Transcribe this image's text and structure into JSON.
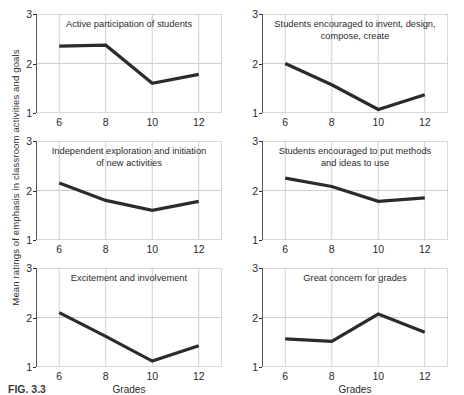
{
  "figure": {
    "ylabel": "Mean ratings of emphasis in classroom activities and goals",
    "xlabel": "Grades",
    "caption": "FIG. 3.3"
  },
  "chart_data": {
    "type": "line",
    "title": "",
    "subtitle": "",
    "xlabel": "Grades",
    "ylabel": "Mean ratings of emphasis in classroom activities and goals",
    "x": [
      6,
      8,
      10,
      12
    ],
    "xticklabels": [
      "6",
      "8",
      "10",
      "12"
    ],
    "yticklabels": [
      "1",
      "2",
      "3"
    ],
    "xlim": [
      5,
      13
    ],
    "ylim": [
      1,
      3
    ],
    "grid": true,
    "legend": "none",
    "panels": [
      {
        "title": "Active participation of students",
        "values": [
          2.35,
          2.37,
          1.6,
          1.78
        ]
      },
      {
        "title": "Students encouraged to invent, design, compose, create",
        "values": [
          2.0,
          1.57,
          1.07,
          1.37
        ]
      },
      {
        "title": "Independent exploration and initiation of new activities",
        "values": [
          2.15,
          1.8,
          1.6,
          1.78
        ]
      },
      {
        "title": "Students encouraged to put methods and ideas to use",
        "values": [
          2.25,
          2.08,
          1.78,
          1.85
        ]
      },
      {
        "title": "Excitement and involvement",
        "values": [
          2.1,
          1.62,
          1.12,
          1.43
        ]
      },
      {
        "title": "Great concern for grades",
        "values": [
          1.57,
          1.52,
          2.07,
          1.7
        ]
      }
    ]
  },
  "colors": {
    "line": "#2b2b2b",
    "grid": "#cfcfcf",
    "frame": "#d9d9d9",
    "text": "#2a2a2a"
  }
}
